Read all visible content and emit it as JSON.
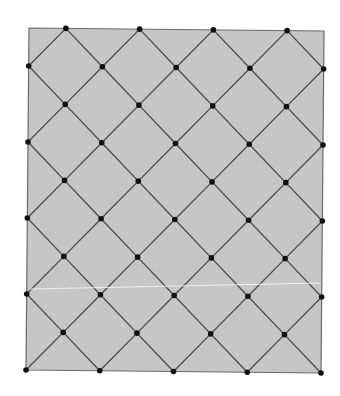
{
  "diagram": {
    "title": "Diamond lattice grid",
    "canvas": {
      "width": 340,
      "height": 396
    },
    "rectangle": {
      "corners": {
        "top_left": [
          29,
          28
        ],
        "top_right": [
          324,
          31
        ],
        "bottom_right": [
          321,
          373
        ],
        "bottom_left": [
          26,
          370
        ]
      },
      "fill": "#c6c6c6",
      "stroke": "#6a6a6a"
    },
    "grid": {
      "columns": 8,
      "rows": 9,
      "dot_rule": "column + row is odd",
      "line_color": "#4f4f4f",
      "line_width": 1.4,
      "dot_color": "#111111",
      "dot_radius": 2.8
    },
    "artifact_line": {
      "from": [
        30,
        289
      ],
      "to": [
        322,
        283
      ],
      "color": "#f2f2f2"
    }
  }
}
